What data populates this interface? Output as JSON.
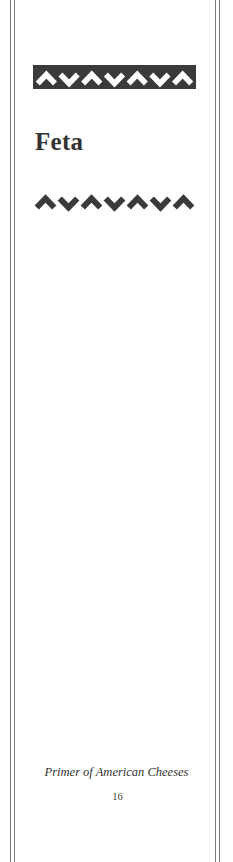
{
  "page": {
    "chapter_title": "Feta",
    "running_footer": "Primer of American Cheeses",
    "page_number": "16"
  },
  "ornaments": {
    "top_band": {
      "icon": "chevron-frieze-icon",
      "pattern": [
        "up",
        "down",
        "up",
        "down",
        "up",
        "down",
        "up"
      ],
      "background": "#3a3a3a",
      "foreground": "#ffffff"
    },
    "under_title": {
      "icon": "chevron-frieze-icon",
      "pattern": [
        "up",
        "down",
        "up",
        "down",
        "up",
        "down",
        "up"
      ],
      "foreground": "#3a3a3a"
    }
  },
  "colors": {
    "text": "#333333",
    "rule": "#7a7a7a"
  }
}
